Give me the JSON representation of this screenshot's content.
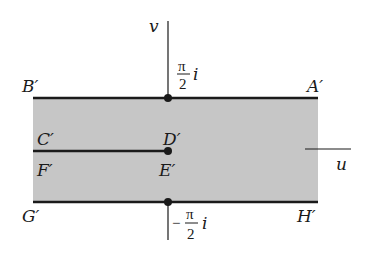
{
  "diagram": {
    "type": "complex-plane-mapping",
    "axes": {
      "horizontal_label": "u",
      "vertical_label": "v"
    },
    "region": {
      "fill_color": "#c8c8c8",
      "description": "horizontal strip between -π/2 i and π/2 i"
    },
    "boundary_labels": {
      "top_left": "B′",
      "top_right": "A′",
      "mid_upper_left": "C′",
      "mid_upper_center": "D′",
      "mid_lower_left": "F′",
      "mid_lower_center": "E′",
      "bottom_left": "G′",
      "bottom_right": "H′"
    },
    "top_tick": {
      "numerator": "π",
      "denominator": "2",
      "suffix": "i",
      "sign": ""
    },
    "bottom_tick": {
      "numerator": "π",
      "denominator": "2",
      "suffix": "i",
      "sign": "−"
    },
    "line_color": "#1a1a1a"
  }
}
